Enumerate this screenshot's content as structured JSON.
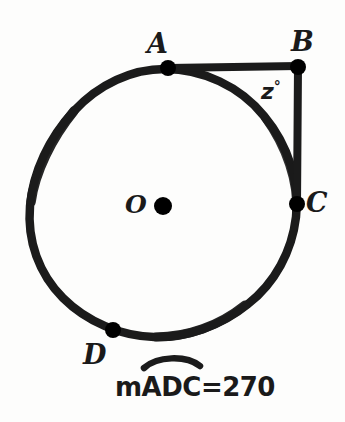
{
  "figure": {
    "type": "circle-geometry-diagram",
    "stroke_color": "#1b1b1b",
    "background_color": "#fdfdfc",
    "circle": {
      "center_label": "O",
      "center_point": {
        "x": 163,
        "y": 206
      },
      "cx": 165,
      "cy": 204,
      "r": 135
    },
    "points": [
      {
        "label": "A",
        "x": 168,
        "y": 68,
        "label_x": 147,
        "label_y": 30
      },
      {
        "label": "B",
        "x": 298,
        "y": 67,
        "label_x": 292,
        "label_y": 28
      },
      {
        "label": "C",
        "x": 298,
        "y": 204,
        "label_x": 306,
        "label_y": 188
      },
      {
        "label": "D",
        "x": 113,
        "y": 330,
        "label_x": 84,
        "label_y": 340
      }
    ],
    "segments": [
      {
        "name": "AB",
        "from": "A",
        "to": "B"
      },
      {
        "name": "BC",
        "from": "B",
        "to": "C"
      }
    ],
    "angle": {
      "name": "angle-ABC",
      "vertex": "B",
      "text": "z",
      "degree_symbol": "°",
      "label_x": 260,
      "label_y": 79
    }
  },
  "caption": {
    "text": "mADC=270",
    "arc_over": "ADC",
    "x": 115,
    "y": 374
  }
}
